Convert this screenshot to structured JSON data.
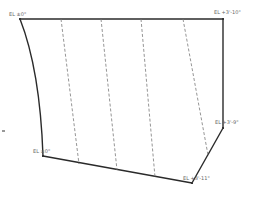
{
  "diagram": {
    "type": "wall-elevation-outline",
    "colors": {
      "outline": "#2a2a2a",
      "dashed": "#7a7a7a",
      "label": "#666666",
      "background": "#ffffff"
    },
    "elevation_labels": [
      {
        "id": "top-left",
        "text": "EL ±0\""
      },
      {
        "id": "top-right",
        "text": "EL +3'-10\""
      },
      {
        "id": "bottom-left",
        "text": "EL ±0\""
      },
      {
        "id": "right-mid",
        "text": "EL +3'-9\""
      },
      {
        "id": "bottom-right",
        "text": "EL +3'-11\""
      }
    ],
    "dashed_line_count": 4
  }
}
